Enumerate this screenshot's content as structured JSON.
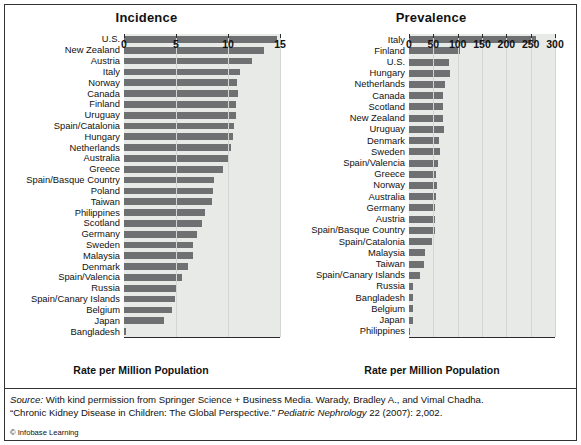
{
  "figure": {
    "background": "#ffffff",
    "bar_color": "#6e7071",
    "plot_background": "#e8eae8",
    "axis_color": "#2b2b2b"
  },
  "source": {
    "label": "Source:",
    "line1_rest": " With kind permission from Springer Science + Business Media. Warady, Bradley A., and Vimal Chadha.",
    "line2_start": "“Chronic Kidney Disease in Children: The Global Perspective.” ",
    "line2_italic": "Pediatric Nephrology",
    "line2_end": " 22 (2007): 2,002.",
    "credit_mark": "©",
    "credit_text": " Infobase Learning"
  },
  "chart_data": [
    {
      "id": "incidence",
      "type": "bar",
      "orientation": "horizontal",
      "title": "Incidence",
      "xlabel": "Rate per Million Population",
      "ylabel": "",
      "xlim": [
        0,
        15
      ],
      "xticks": [
        0,
        5,
        10,
        15
      ],
      "xticklabels": [
        "0",
        "5",
        "10",
        "15"
      ],
      "grid": true,
      "legend": "none",
      "categories": [
        "U.S.",
        "New Zealand",
        "Austria",
        "Italy",
        "Norway",
        "Canada",
        "Finland",
        "Uruguay",
        "Spain/Catalonia",
        "Hungary",
        "Netherlands",
        "Australia",
        "Greece",
        "Spain/Basque Country",
        "Poland",
        "Taiwan",
        "Philippines",
        "Scotland",
        "Germany",
        "Sweden",
        "Malaysia",
        "Denmark",
        "Spain/Valencia",
        "Russia",
        "Spain/Canary Islands",
        "Belgium",
        "Japan",
        "Bangladesh"
      ],
      "values": [
        14.7,
        13.5,
        12.3,
        11.2,
        10.9,
        11.0,
        10.8,
        10.8,
        10.6,
        10.5,
        10.3,
        10.0,
        9.5,
        8.7,
        8.6,
        8.5,
        7.8,
        7.5,
        7.0,
        6.6,
        6.6,
        6.2,
        5.6,
        5.1,
        4.9,
        4.6,
        3.8,
        0.15
      ]
    },
    {
      "id": "prevalence",
      "type": "bar",
      "orientation": "horizontal",
      "title": "Prevalence",
      "xlabel": "Rate per Million Population",
      "ylabel": "",
      "xlim": [
        0,
        300
      ],
      "xticks": [
        0,
        50,
        100,
        150,
        200,
        250,
        300
      ],
      "xticklabels": [
        "0",
        "50",
        "100",
        "150",
        "200",
        "250",
        "300"
      ],
      "grid": true,
      "legend": "none",
      "categories": [
        "Italy",
        "Finland",
        "U.S.",
        "Hungary",
        "Netherlands",
        "Canada",
        "Scotland",
        "New Zealand",
        "Uruguay",
        "Denmark",
        "Sweden",
        "Spain/Valencia",
        "Greece",
        "Norway",
        "Australia",
        "Germany",
        "Austria",
        "Spain/Basque Country",
        "Spain/Catalonia",
        "Malaysia",
        "Taiwan",
        "Spain/Canary Islands",
        "Russia",
        "Bangladesh",
        "Belgium",
        "Japan",
        "Philippines"
      ],
      "values": [
        260,
        104,
        82,
        84,
        74,
        70,
        70,
        70,
        72,
        62,
        64,
        60,
        56,
        58,
        56,
        54,
        54,
        54,
        48,
        32,
        30,
        22,
        8,
        8,
        8,
        8,
        2
      ]
    }
  ]
}
